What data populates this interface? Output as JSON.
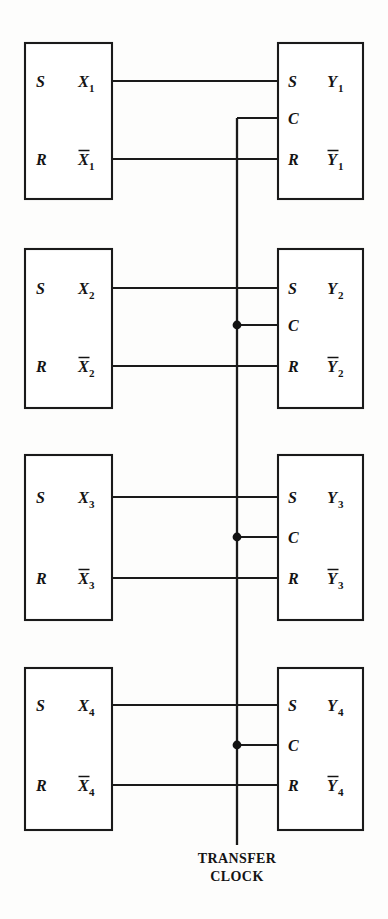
{
  "diagram": {
    "background_color": "#fdfdfc",
    "line_color": "#1a1a1a",
    "canvas": {
      "width": 388,
      "height": 919
    },
    "clock_bus": {
      "label_line_1": "TRANSFER",
      "label_line_2": "CLOCK",
      "x": 237,
      "top_y": 118,
      "bottom_y": 845,
      "caption_x": 237,
      "caption_y_1": 863,
      "caption_y_2": 881
    },
    "source_register": {
      "name": "X register",
      "box_x": 25,
      "box_width": 87,
      "pin_in_s": "S",
      "pin_in_r": "R"
    },
    "destination_register": {
      "name": "Y register",
      "box_x": 278,
      "box_width": 85,
      "pin_in_s": "S",
      "pin_in_c": "C",
      "pin_in_r": "R"
    },
    "stages": [
      {
        "index": 1,
        "box_top": 43,
        "box_bottom": 199,
        "s_wire_y": 81,
        "c_wire_y": 118,
        "r_wire_y": 159,
        "has_junction_dot": false,
        "left_out_true": "X",
        "left_out_true_sub": "1",
        "left_out_bar": "X",
        "left_out_bar_sub": "1",
        "left_in_s": "S",
        "left_in_r": "R",
        "right_in_s": "S",
        "right_in_c": "C",
        "right_in_r": "R",
        "right_out_true": "Y",
        "right_out_true_sub": "1",
        "right_out_bar": "Y",
        "right_out_bar_sub": "1"
      },
      {
        "index": 2,
        "box_top": 249,
        "box_bottom": 408,
        "s_wire_y": 288,
        "c_wire_y": 325,
        "r_wire_y": 366,
        "has_junction_dot": true,
        "left_out_true": "X",
        "left_out_true_sub": "2",
        "left_out_bar": "X",
        "left_out_bar_sub": "2",
        "left_in_s": "S",
        "left_in_r": "R",
        "right_in_s": "S",
        "right_in_c": "C",
        "right_in_r": "R",
        "right_out_true": "Y",
        "right_out_true_sub": "2",
        "right_out_bar": "Y",
        "right_out_bar_sub": "2"
      },
      {
        "index": 3,
        "box_top": 455,
        "box_bottom": 620,
        "s_wire_y": 497,
        "c_wire_y": 537,
        "r_wire_y": 578,
        "has_junction_dot": true,
        "left_out_true": "X",
        "left_out_true_sub": "3",
        "left_out_bar": "X",
        "left_out_bar_sub": "3",
        "left_in_s": "S",
        "left_in_r": "R",
        "right_in_s": "S",
        "right_in_c": "C",
        "right_in_r": "R",
        "right_out_true": "Y",
        "right_out_true_sub": "3",
        "right_out_bar": "Y",
        "right_out_bar_sub": "3"
      },
      {
        "index": 4,
        "box_top": 668,
        "box_bottom": 830,
        "s_wire_y": 705,
        "c_wire_y": 745,
        "r_wire_y": 785,
        "has_junction_dot": true,
        "left_out_true": "X",
        "left_out_true_sub": "4",
        "left_out_bar": "X",
        "left_out_bar_sub": "4",
        "left_in_s": "S",
        "left_in_r": "R",
        "right_in_s": "S",
        "right_in_c": "C",
        "right_in_r": "R",
        "right_out_true": "Y",
        "right_out_true_sub": "4",
        "right_out_bar": "Y",
        "right_out_bar_sub": "4"
      }
    ]
  }
}
